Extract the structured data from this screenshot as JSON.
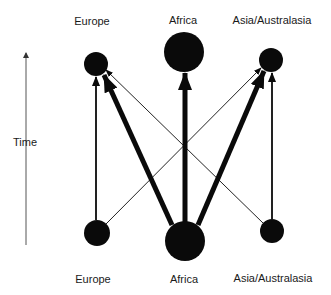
{
  "diagram": {
    "axis": {
      "label": "Time",
      "direction": "up"
    },
    "top_labels": [
      "Europe",
      "Africa",
      "Asia/Australasia"
    ],
    "bottom_labels": [
      "Europe",
      "Africa",
      "Asia/Australasia"
    ],
    "nodes": {
      "top": [
        {
          "region": "Europe",
          "size": "medium"
        },
        {
          "region": "Africa",
          "size": "large"
        },
        {
          "region": "Asia/Australasia",
          "size": "medium"
        }
      ],
      "bottom": [
        {
          "region": "Europe",
          "size": "medium"
        },
        {
          "region": "Africa",
          "size": "large"
        },
        {
          "region": "Asia/Australasia",
          "size": "medium"
        }
      ]
    },
    "edges": [
      {
        "from": "Europe (bottom)",
        "to": "Europe (top)",
        "weight": "medium"
      },
      {
        "from": "Africa (bottom)",
        "to": "Africa (top)",
        "weight": "thick"
      },
      {
        "from": "Asia/Australasia (bottom)",
        "to": "Asia/Australasia (top)",
        "weight": "medium"
      },
      {
        "from": "Africa (bottom)",
        "to": "Europe (top)",
        "weight": "thick"
      },
      {
        "from": "Africa (bottom)",
        "to": "Asia/Australasia (top)",
        "weight": "thick"
      },
      {
        "from": "Europe (bottom)",
        "to": "Asia/Australasia (top)",
        "weight": "thin"
      },
      {
        "from": "Asia/Australasia (bottom)",
        "to": "Europe (top)",
        "weight": "thin"
      }
    ],
    "colors": {
      "node": "#0a0a0a",
      "edge": "#0a0a0a",
      "axis": "#555555",
      "text": "#1a1a1a"
    }
  }
}
